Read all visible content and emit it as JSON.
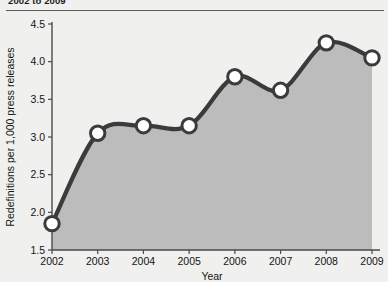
{
  "title": "2002 to 2009",
  "chart_data": {
    "type": "area",
    "title": "2002 to 2009",
    "xlabel": "Year",
    "ylabel": "Redefinitions per 1,000 press releases",
    "categories": [
      "2002",
      "2003",
      "2004",
      "2005",
      "2006",
      "2007",
      "2008",
      "2009"
    ],
    "x": [
      2002,
      2003,
      2004,
      2005,
      2006,
      2007,
      2008,
      2009
    ],
    "values": [
      1.85,
      3.05,
      3.15,
      3.15,
      3.8,
      3.62,
      4.25,
      4.05
    ],
    "xlim": [
      2002,
      2009
    ],
    "ylim": [
      1.5,
      4.5
    ],
    "ytick_labels": [
      "1.5",
      "2.0",
      "2.5",
      "3.0",
      "3.5",
      "4.0",
      "4.5"
    ],
    "yticks": [
      1.5,
      2.0,
      2.5,
      3.0,
      3.5,
      4.0,
      4.5
    ],
    "xtick_labels": [
      "2002",
      "2003",
      "2004",
      "2005",
      "2006",
      "2007",
      "2008",
      "2009"
    ],
    "grid": false,
    "legend": "none",
    "marker": "open-circle",
    "colors": {
      "line": "#3b3b3b",
      "fill": "#bcbcbc",
      "marker_face": "#ffffff",
      "marker_edge": "#3b3b3b",
      "axis": "#4a4a4a",
      "background": "#f0f0ee",
      "text": "#141414"
    }
  }
}
